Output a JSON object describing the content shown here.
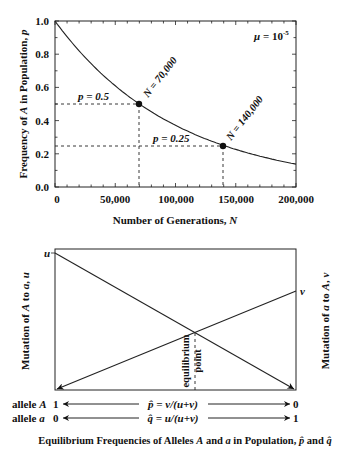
{
  "chart_data": [
    {
      "type": "line",
      "title": "",
      "xlabel": "Number of Generations, N",
      "ylabel": "Frequency of A in Population, p",
      "xlim": [
        0,
        200000
      ],
      "ylim": [
        0.0,
        1.0
      ],
      "x_ticks": [
        "0",
        "50,000",
        "100,000",
        "150,000",
        "200,000"
      ],
      "y_ticks": [
        "0.0",
        "0.2",
        "0.4",
        "0.6",
        "0.8",
        "1.0"
      ],
      "annotation_mu": "μ = 10⁻⁵",
      "mu_prefix": "μ = 10",
      "mu_exp": "-5",
      "series": [
        {
          "name": "p = e^(-μN)",
          "x": [
            0,
            20000,
            40000,
            60000,
            70000,
            80000,
            100000,
            120000,
            140000,
            160000,
            180000,
            200000
          ],
          "values": [
            1.0,
            0.82,
            0.67,
            0.55,
            0.5,
            0.45,
            0.37,
            0.3,
            0.25,
            0.2,
            0.165,
            0.135
          ]
        }
      ],
      "marked_points": [
        {
          "x": 70000,
          "y": 0.5,
          "label_p": "p = 0.5",
          "label_n": "N = 70,000"
        },
        {
          "x": 140000,
          "y": 0.25,
          "label_p": "p = 0.25",
          "label_n": "N = 140,000"
        }
      ],
      "grid": false
    },
    {
      "type": "line",
      "title": "Equilibrium Frequencies of Alleles A and a in Population, p̂ and q̂",
      "ylabel_left": "Mutation of A to a, u",
      "ylabel_right": "Mutation of a to A, v",
      "left_marker": "u",
      "right_marker": "v",
      "series": [
        {
          "name": "u",
          "x": [
            0,
            1
          ],
          "values": [
            1.0,
            0.0
          ]
        },
        {
          "name": "v",
          "x": [
            0,
            1
          ],
          "values": [
            0.0,
            0.73
          ]
        }
      ],
      "equilibrium_label": [
        "equilibrium",
        "point"
      ],
      "rows": [
        {
          "label": "allele A",
          "left": "1",
          "formula": "p̂ = v/(u+v)",
          "right": "0"
        },
        {
          "label": "allele a",
          "left": "0",
          "formula": "q̂ = u/(u+v)",
          "right": "1"
        }
      ]
    }
  ],
  "top": {
    "xlabel": "Number of Generations,",
    "xlabel_var": "N",
    "ylabel_prefix": "Frequency of",
    "ylabel_var": "A",
    "ylabel_suffix": "in Population,",
    "ylabel_var2": "p"
  },
  "bottom": {
    "u": "u",
    "v": "v",
    "left_label": "Mutation of A to a, u",
    "right_label": "Mutation of a to A, v",
    "eq1": "equilibrium",
    "eq2": "point",
    "row1_label": "allele",
    "row1_var": "A",
    "row1_left": "1",
    "row1_formula": "p̂ = v/(u+v)",
    "row1_right": "0",
    "row2_label": "allele",
    "row2_var": "a",
    "row2_left": "0",
    "row2_formula": "q̂ = u/(u+v)",
    "row2_right": "1",
    "title": "Equilibrium Frequencies of Alleles A and a in Population, p̂ and q̂"
  }
}
